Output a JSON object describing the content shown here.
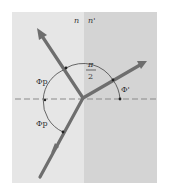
{
  "diagram": {
    "media": {
      "left": {
        "label": "n",
        "color": "#e6e6e6"
      },
      "right": {
        "label": "n'",
        "color": "#d4d4d4"
      }
    },
    "angles": {
      "incident": {
        "label": "Φp"
      },
      "reflected": {
        "label": "Φp"
      },
      "right_angle": {
        "numerator": "π",
        "denominator": "2"
      },
      "refracted": {
        "label": "Φ'"
      }
    },
    "colors": {
      "ray": "#6e6e6e",
      "arc": "#444444",
      "normal_dashed": "#8a8a8a"
    }
  }
}
